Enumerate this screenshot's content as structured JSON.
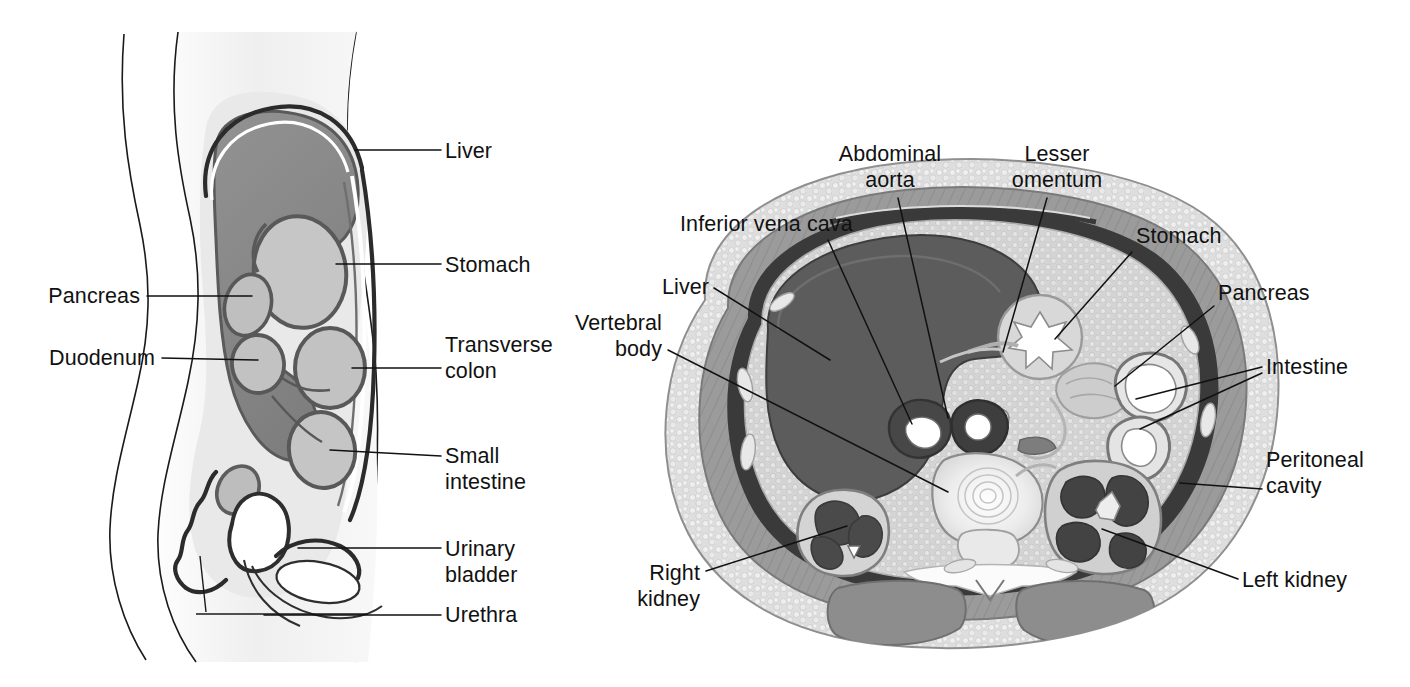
{
  "figure": {
    "background_color": "#ffffff",
    "ink_color": "#111111"
  },
  "panels": [
    {
      "id": "sagittal",
      "name": "Sagittal section of abdomen",
      "view": "lateral / side view",
      "palette": {
        "skin_fill": "#f4f4f4",
        "body_cavity_fill": "#e3e3e3",
        "liver_fill": "#8a8a8a",
        "stomach_fill": "#c9c9c9",
        "organ_fill": "#bdbdbd",
        "peritoneum_stroke": "#2b2b2b",
        "organ_stroke": "#555555"
      },
      "labels": [
        {
          "id": "liver",
          "text": "Liver",
          "lines": [
            "Liver"
          ],
          "align": "start",
          "x": 445,
          "y": 158,
          "leader": [
            [
              441,
              150
            ],
            [
              395,
              150
            ],
            [
              355,
              150
            ]
          ]
        },
        {
          "id": "stomach",
          "text": "Stomach",
          "lines": [
            "Stomach"
          ],
          "align": "start",
          "x": 445,
          "y": 272,
          "leader": [
            [
              441,
              264
            ],
            [
              390,
              264
            ],
            [
              340,
              264
            ]
          ]
        },
        {
          "id": "pancreas",
          "text": "Pancreas",
          "lines": [
            "Pancreas"
          ],
          "align": "end",
          "x": 140,
          "y": 303,
          "leader": [
            [
              147,
              296
            ],
            [
              200,
              296
            ],
            [
              252,
              296
            ]
          ]
        },
        {
          "id": "transverse-colon",
          "text": "Transverse colon",
          "lines": [
            "Transverse",
            "colon"
          ],
          "align": "start",
          "x": 445,
          "y": 352,
          "leader": [
            [
              441,
              368
            ],
            [
              392,
              368
            ],
            [
              352,
              368
            ]
          ]
        },
        {
          "id": "duodenum",
          "text": "Duodenum",
          "lines": [
            "Duodenum"
          ],
          "align": "end",
          "x": 155,
          "y": 365,
          "leader": [
            [
              162,
              358
            ],
            [
              212,
              358
            ],
            [
              262,
              358
            ]
          ]
        },
        {
          "id": "small-intestine",
          "text": "Small intestine",
          "lines": [
            "Small",
            "intestine"
          ],
          "align": "start",
          "x": 445,
          "y": 463,
          "leader": [
            [
              441,
              456
            ],
            [
              390,
              456
            ],
            [
              338,
              450
            ]
          ]
        },
        {
          "id": "urinary-bladder",
          "text": "Urinary bladder",
          "lines": [
            "Urinary",
            "bladder"
          ],
          "align": "start",
          "x": 445,
          "y": 556,
          "leader": [
            [
              441,
              548
            ],
            [
              380,
              548
            ],
            [
              300,
              548
            ]
          ]
        },
        {
          "id": "urethra",
          "text": "Urethra",
          "lines": [
            "Urethra"
          ],
          "align": "start",
          "x": 445,
          "y": 622,
          "leader": [
            [
              441,
              615
            ],
            [
              360,
              615
            ],
            [
              268,
              615
            ]
          ]
        }
      ]
    },
    {
      "id": "transverse",
      "name": "Transverse (cross) section of abdomen",
      "view": "axial / cross-section",
      "palette": {
        "subcutaneous_fat": "#dcdcdc",
        "muscle_wall": "#9b9b9b",
        "peritoneal_space": "#3a3a3a",
        "liver_fill": "#5f5f5f",
        "mesentery_fill": "#cfcfcf",
        "vertebra_fill": "#efefef",
        "kidney_fill": "#4e4e4e",
        "lumen_white": "#ffffff"
      },
      "labels": [
        {
          "id": "abdominal-aorta",
          "text": "Abdominal aorta",
          "lines": [
            "Abdominal",
            "aorta"
          ],
          "align": "mid",
          "x": 890,
          "y": 160,
          "leader": [
            [
              898,
              198
            ],
            [
              930,
              330
            ],
            [
              948,
              418
            ]
          ]
        },
        {
          "id": "lesser-omentum",
          "text": "Lesser omentum",
          "lines": [
            "Lesser",
            "omentum"
          ],
          "align": "mid",
          "x": 1057,
          "y": 160,
          "leader": [
            [
              1047,
              198
            ],
            [
              1020,
              300
            ],
            [
              1003,
              352
            ]
          ]
        },
        {
          "id": "inferior-vena-cava",
          "text": "Inferior vena cava",
          "lines": [
            "Inferior vena cava"
          ],
          "align": "start",
          "x": 680,
          "y": 230,
          "leader": [
            [
              828,
              240
            ],
            [
              880,
              350
            ],
            [
              912,
              424
            ]
          ]
        },
        {
          "id": "stomach",
          "text": "Stomach",
          "lines": [
            "Stomach"
          ],
          "align": "start",
          "x": 1136,
          "y": 243,
          "leader": [
            [
              1132,
              252
            ],
            [
              1090,
              300
            ],
            [
              1057,
              339
            ]
          ]
        },
        {
          "id": "liver",
          "text": "Liver",
          "lines": [
            "Liver"
          ],
          "align": "start",
          "x": 662,
          "y": 293,
          "leader": [
            [
              714,
              288
            ],
            [
              780,
              330
            ],
            [
              830,
              360
            ]
          ]
        },
        {
          "id": "pancreas",
          "text": "Pancreas",
          "lines": [
            "Pancreas"
          ],
          "align": "start",
          "x": 1218,
          "y": 300,
          "leader": [
            [
              1214,
              306
            ],
            [
              1160,
              350
            ],
            [
              1117,
              385
            ]
          ]
        },
        {
          "id": "vertebral-body",
          "text": "Vertebral body",
          "lines": [
            "Vertebral",
            "body"
          ],
          "align": "end",
          "x": 662,
          "y": 330,
          "leader": [
            [
              668,
              350
            ],
            [
              830,
              430
            ],
            [
              948,
              492
            ]
          ]
        },
        {
          "id": "intestine",
          "text": "Intestine",
          "lines": [
            "Intestine"
          ],
          "align": "start",
          "x": 1266,
          "y": 373,
          "leader_multi": [
            [
              [
                1262,
                367
              ],
              [
                1190,
                382
              ],
              [
                1136,
                399
              ]
            ],
            [
              [
                1262,
                373
              ],
              [
                1190,
                404
              ],
              [
                1140,
                429
              ]
            ]
          ]
        },
        {
          "id": "peritoneal-cavity",
          "text": "Peritoneal cavity",
          "lines": [
            "Peritoneal",
            "cavity"
          ],
          "align": "start",
          "x": 1266,
          "y": 467,
          "leader": [
            [
              1262,
              489
            ],
            [
              1220,
              489
            ],
            [
              1180,
              483
            ]
          ]
        },
        {
          "id": "right-kidney",
          "text": "Right kidney",
          "lines": [
            "Right",
            "kidney"
          ],
          "align": "end",
          "x": 700,
          "y": 580,
          "leader": [
            [
              706,
              571
            ],
            [
              790,
              545
            ],
            [
              847,
              526
            ]
          ]
        },
        {
          "id": "left-kidney",
          "text": "Left kidney",
          "lines": [
            "Left kidney"
          ],
          "align": "start",
          "x": 1242,
          "y": 586,
          "leader": [
            [
              1238,
              579
            ],
            [
              1160,
              552
            ],
            [
              1102,
              529
            ]
          ]
        }
      ]
    }
  ]
}
